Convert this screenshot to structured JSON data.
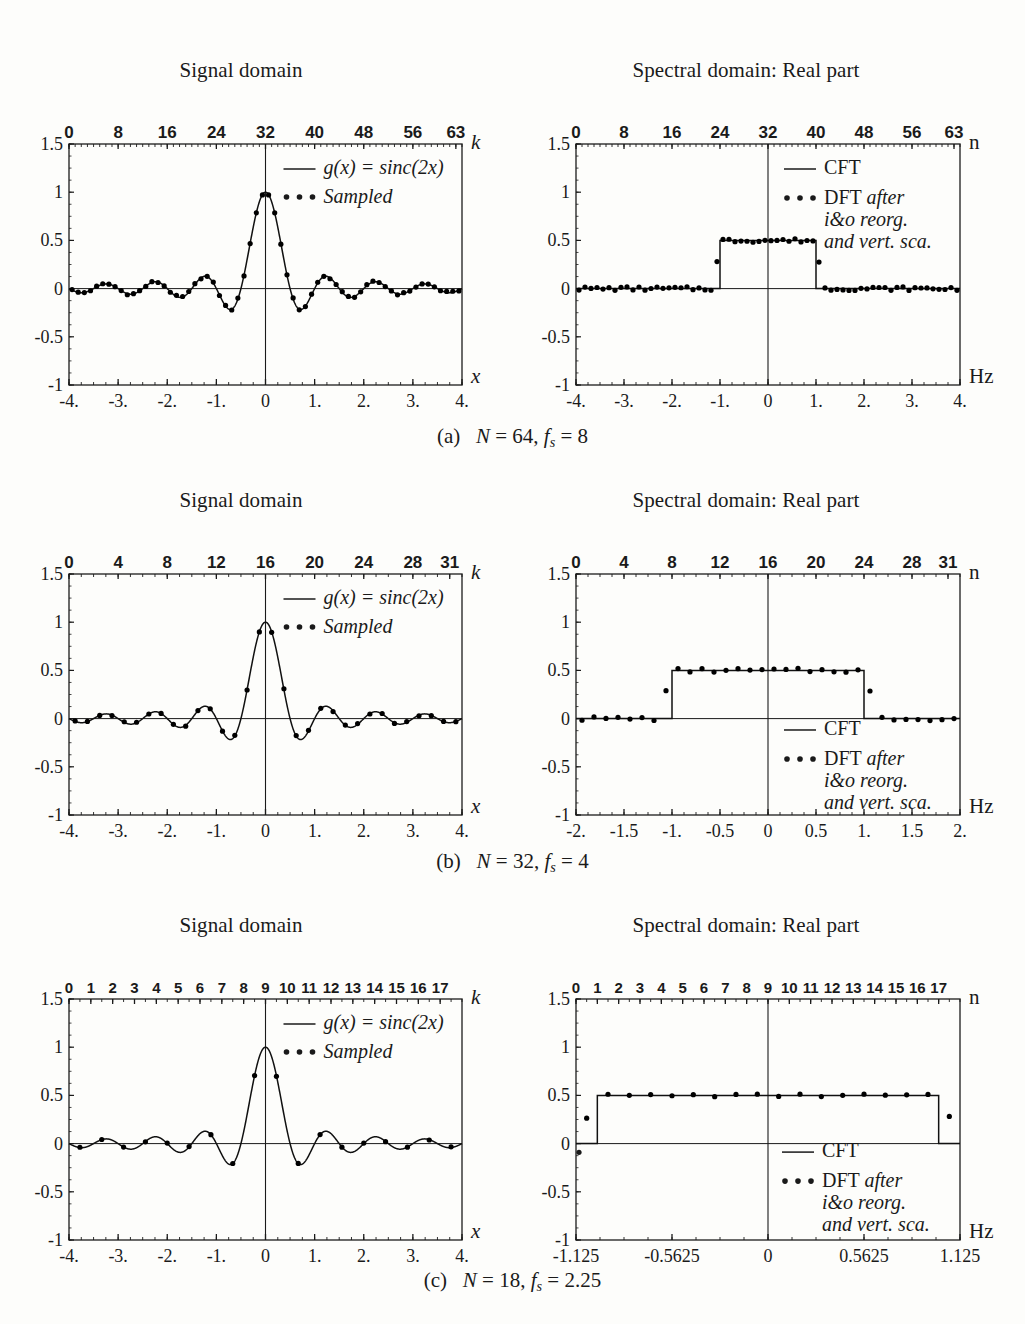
{
  "figure": {
    "left_panel_title": "Signal domain",
    "right_panel_title": "Spectral domain: Real part"
  },
  "captions": {
    "a": {
      "tag": "(a)",
      "N_label": "N",
      "N_value": "64",
      "fs_label": "f",
      "fs_sub": "s",
      "fs_value": "8"
    },
    "b": {
      "tag": "(b)",
      "N_label": "N",
      "N_value": "32",
      "fs_label": "f",
      "fs_sub": "s",
      "fs_value": "4"
    },
    "c": {
      "tag": "(c)",
      "N_label": "N",
      "N_value": "18",
      "fs_label": "f",
      "fs_sub": "s",
      "fs_value": "2.25"
    }
  },
  "legends": {
    "signal": {
      "line_label": "g(x) = sinc(2x)",
      "dots_label": "Sampled",
      "dots_glyph": "• • •",
      "line_glyph": "—"
    },
    "spectral": {
      "line_label": "CFT",
      "dots_label_1": "DFT after",
      "dots_label_2": "i&o reorg.",
      "dots_label_3": "and vert. sca.",
      "dots_glyph": "• • •",
      "line_glyph": "—"
    }
  },
  "axis_labels": {
    "top_signal": "k",
    "top_spectral": "n",
    "bottom_signal": "x",
    "bottom_spectral": "Hz"
  },
  "colors": {
    "ink": "#1a1a1a",
    "frame": "#2b2b2b",
    "curve": "#111111",
    "dots": "#000000"
  },
  "chart_data": [
    {
      "id": "a-signal",
      "type": "line",
      "title": "Signal domain",
      "panel": "(a) N = 64, fs = 8",
      "xlabel": "x",
      "ylabel": "",
      "top_axis_label": "k",
      "xlim": [
        -4,
        4
      ],
      "ylim": [
        -1,
        1.5
      ],
      "yticks": [
        -1,
        -0.5,
        0,
        0.5,
        1,
        1.5
      ],
      "ytick_labels": [
        "-1",
        "-0.5",
        "0",
        "0.5",
        "1",
        "1.5"
      ],
      "xticks": [
        -4,
        -3,
        -2,
        -1,
        0,
        1,
        2,
        3,
        4
      ],
      "xtick_labels": [
        "-4.",
        "-3.",
        "-2.",
        "-1.",
        "0",
        "1.",
        "2.",
        "3.",
        "4."
      ],
      "top_ticks": [
        0,
        8,
        16,
        24,
        32,
        40,
        48,
        56,
        63
      ],
      "top_tick_labels": [
        "0",
        "8",
        "16",
        "24",
        "32",
        "40",
        "48",
        "56",
        "63"
      ],
      "top_tick_range": [
        0,
        64
      ],
      "top_minor_step": 1,
      "grid": false,
      "vline_at": 0,
      "hline_at": 0,
      "series": [
        {
          "name": "g(x) = sinc(2x)",
          "style": "line",
          "func": "sinc2"
        },
        {
          "name": "Sampled",
          "style": "dots",
          "func": "sinc2",
          "n_samples": 64,
          "sample_step": 0.125,
          "jitter": 0.012
        }
      ]
    },
    {
      "id": "a-spectral",
      "type": "line",
      "title": "Spectral domain: Real part",
      "panel": "(a) N = 64, fs = 8",
      "xlabel": "Hz",
      "ylabel": "",
      "top_axis_label": "n",
      "xlim": [
        -4,
        4
      ],
      "ylim": [
        -1,
        1.5
      ],
      "yticks": [
        -1,
        -0.5,
        0,
        0.5,
        1,
        1.5
      ],
      "ytick_labels": [
        "-1",
        "-0.5",
        "0",
        "0.5",
        "1",
        "1.5"
      ],
      "xticks": [
        -4,
        -3,
        -2,
        -1,
        0,
        1,
        2,
        3,
        4
      ],
      "xtick_labels": [
        "-4.",
        "-3.",
        "-2.",
        "-1.",
        "0",
        "1.",
        "2.",
        "3.",
        "4."
      ],
      "top_ticks": [
        0,
        8,
        16,
        24,
        32,
        40,
        48,
        56,
        63
      ],
      "top_tick_labels": [
        "0",
        "8",
        "16",
        "24",
        "32",
        "40",
        "48",
        "56",
        "63"
      ],
      "top_tick_range": [
        0,
        64
      ],
      "top_minor_step": 1,
      "grid": false,
      "vline_at": 0,
      "hline_at": 0,
      "rect_pulse": {
        "from": -1,
        "to": 1,
        "height": 0.5
      },
      "series": [
        {
          "name": "CFT",
          "style": "line",
          "func": "rect"
        },
        {
          "name": "DFT after i&o reorg. and vert. sca.",
          "style": "dots",
          "func": "rect",
          "n_samples": 64,
          "sample_step": 0.125,
          "jitter": 0.02
        }
      ]
    },
    {
      "id": "b-signal",
      "type": "line",
      "title": "Signal domain",
      "panel": "(b) N = 32, fs = 4",
      "xlabel": "x",
      "top_axis_label": "k",
      "xlim": [
        -4,
        4
      ],
      "ylim": [
        -1,
        1.5
      ],
      "yticks": [
        -1,
        -0.5,
        0,
        0.5,
        1,
        1.5
      ],
      "ytick_labels": [
        "-1",
        "-0.5",
        "0",
        "0.5",
        "1",
        "1.5"
      ],
      "xticks": [
        -4,
        -3,
        -2,
        -1,
        0,
        1,
        2,
        3,
        4
      ],
      "xtick_labels": [
        "-4.",
        "-3.",
        "-2.",
        "-1.",
        "0",
        "1.",
        "2.",
        "3.",
        "4."
      ],
      "top_ticks": [
        0,
        4,
        8,
        12,
        16,
        20,
        24,
        28,
        31
      ],
      "top_tick_labels": [
        "0",
        "4",
        "8",
        "12",
        "16",
        "20",
        "24",
        "28",
        "31"
      ],
      "top_tick_range": [
        0,
        32
      ],
      "top_minor_step": 1,
      "grid": false,
      "vline_at": 0,
      "hline_at": 0,
      "series": [
        {
          "name": "g(x) = sinc(2x)",
          "style": "line",
          "func": "sinc2"
        },
        {
          "name": "Sampled",
          "style": "dots",
          "func": "sinc2",
          "n_samples": 32,
          "sample_step": 0.25,
          "jitter": 0.01
        }
      ]
    },
    {
      "id": "b-spectral",
      "type": "line",
      "title": "Spectral domain: Real part",
      "panel": "(b) N = 32, fs = 4",
      "xlabel": "Hz",
      "top_axis_label": "n",
      "xlim": [
        -2,
        2
      ],
      "ylim": [
        -1,
        1.5
      ],
      "yticks": [
        -1,
        -0.5,
        0,
        0.5,
        1,
        1.5
      ],
      "ytick_labels": [
        "-1",
        "-0.5",
        "0",
        "0.5",
        "1",
        "1.5"
      ],
      "xticks": [
        -2,
        -1.5,
        -1,
        -0.5,
        0,
        0.5,
        1,
        1.5,
        2
      ],
      "xtick_labels": [
        "-2.",
        "-1.5",
        "-1.",
        "-0.5",
        "0",
        "0.5",
        "1.",
        "1.5",
        "2."
      ],
      "top_ticks": [
        0,
        4,
        8,
        12,
        16,
        20,
        24,
        28,
        31
      ],
      "top_tick_labels": [
        "0",
        "4",
        "8",
        "12",
        "16",
        "20",
        "24",
        "28",
        "31"
      ],
      "top_tick_range": [
        0,
        32
      ],
      "top_minor_step": 1,
      "grid": false,
      "vline_at": 0,
      "hline_at": 0,
      "rect_pulse": {
        "from": -1,
        "to": 1,
        "height": 0.5
      },
      "series": [
        {
          "name": "CFT",
          "style": "line",
          "func": "rect"
        },
        {
          "name": "DFT after i&o reorg. and vert. sca.",
          "style": "dots",
          "func": "rect",
          "n_samples": 32,
          "sample_step": 0.125,
          "jitter": 0.022
        }
      ]
    },
    {
      "id": "c-signal",
      "type": "line",
      "title": "Signal domain",
      "panel": "(c) N = 18, fs = 2.25",
      "xlabel": "x",
      "top_axis_label": "k",
      "xlim": [
        -4,
        4
      ],
      "ylim": [
        -1,
        1.5
      ],
      "yticks": [
        -1,
        -0.5,
        0,
        0.5,
        1,
        1.5
      ],
      "ytick_labels": [
        "-1",
        "-0.5",
        "0",
        "0.5",
        "1",
        "1.5"
      ],
      "xticks": [
        -4,
        -3,
        -2,
        -1,
        0,
        1,
        2,
        3,
        4
      ],
      "xtick_labels": [
        "-4.",
        "-3.",
        "-2.",
        "-1.",
        "0",
        "1.",
        "2.",
        "3.",
        "4."
      ],
      "top_ticks": [
        0,
        1,
        2,
        3,
        4,
        5,
        6,
        7,
        8,
        9,
        10,
        11,
        12,
        13,
        14,
        15,
        16,
        17
      ],
      "top_tick_labels": [
        "0",
        "1",
        "2",
        "3",
        "4",
        "5",
        "6",
        "7",
        "8",
        "9",
        "10",
        "11",
        "12",
        "13",
        "14",
        "15",
        "16",
        "17"
      ],
      "top_tick_range": [
        0,
        18
      ],
      "top_minor_step": 0.5,
      "grid": false,
      "vline_at": 0,
      "hline_at": 0,
      "series": [
        {
          "name": "g(x) = sinc(2x)",
          "style": "line",
          "func": "sinc2"
        },
        {
          "name": "Sampled",
          "style": "dots",
          "func": "sinc2",
          "n_samples": 18,
          "sample_step": 0.4444,
          "jitter": 0.008
        }
      ]
    },
    {
      "id": "c-spectral",
      "type": "line",
      "title": "Spectral domain: Real part",
      "panel": "(c) N = 18, fs = 2.25",
      "xlabel": "Hz",
      "top_axis_label": "n",
      "xlim": [
        -1.125,
        1.125
      ],
      "ylim": [
        -1,
        1.5
      ],
      "yticks": [
        -1,
        -0.5,
        0,
        0.5,
        1,
        1.5
      ],
      "ytick_labels": [
        "-1",
        "-0.5",
        "0",
        "0.5",
        "1",
        "1.5"
      ],
      "xticks": [
        -1.125,
        -0.5625,
        0,
        0.5625,
        1.125
      ],
      "xtick_labels": [
        "-1.125",
        "-0.5625",
        "0",
        "0.5625",
        "1.125"
      ],
      "top_ticks": [
        0,
        1,
        2,
        3,
        4,
        5,
        6,
        7,
        8,
        9,
        10,
        11,
        12,
        13,
        14,
        15,
        16,
        17
      ],
      "top_tick_labels": [
        "0",
        "1",
        "2",
        "3",
        "4",
        "5",
        "6",
        "7",
        "8",
        "9",
        "10",
        "11",
        "12",
        "13",
        "14",
        "15",
        "16",
        "17"
      ],
      "top_tick_range": [
        0,
        18
      ],
      "top_minor_step": 0.5,
      "grid": false,
      "vline_at": 0,
      "hline_at": 0,
      "rect_pulse": {
        "from": -1,
        "to": 1,
        "height": 0.5
      },
      "series": [
        {
          "name": "CFT",
          "style": "line",
          "func": "rect"
        },
        {
          "name": "DFT after i&o reorg. and vert. sca.",
          "style": "dots",
          "func": "rect",
          "n_samples": 18,
          "sample_step": 0.125,
          "jitter": 0.015
        }
      ]
    }
  ]
}
